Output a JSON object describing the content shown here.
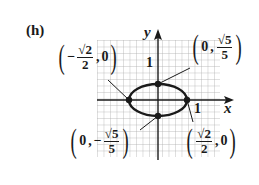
{
  "figure": {
    "part_label": "(h)",
    "axes": {
      "x_label": "x",
      "y_label": "y",
      "x_tick_label": "1",
      "y_tick_label": "1"
    },
    "curve": "ellipse",
    "points": [
      {
        "id": "left",
        "x_sign": "−",
        "x_num": "√2",
        "x_den": "2",
        "y": "0"
      },
      {
        "id": "right",
        "x_num": "√2",
        "x_den": "2",
        "y": "0"
      },
      {
        "id": "top",
        "x": "0",
        "y_num": "√5",
        "y_den": "5"
      },
      {
        "id": "bottom",
        "x": "0",
        "y_sign": "−",
        "y_num": "√5",
        "y_den": "5"
      }
    ],
    "colors": {
      "ink": "#1a1a1a",
      "grid": "#9a9a9a",
      "background": "#ffffff"
    }
  }
}
